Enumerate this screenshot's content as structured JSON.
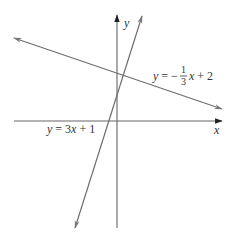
{
  "diagram": {
    "type": "coordinate-plane-lines",
    "axes": {
      "x_label": "x",
      "y_label": "y",
      "color": "#555555"
    },
    "lines": [
      {
        "id": "steep",
        "equation": "y = 3x + 1",
        "label_parts": {
          "lhs": "y",
          "eq": " = ",
          "coef": "3",
          "var": "x",
          "rest": " + 1"
        },
        "color": "#6e6e6e"
      },
      {
        "id": "shallow",
        "equation": "y = -1/3 x + 2",
        "label_parts": {
          "lhs": "y",
          "eq": " = −",
          "num": "1",
          "den": "3",
          "var": "x",
          "rest": " + 2"
        },
        "color": "#6e6e6e"
      }
    ]
  }
}
